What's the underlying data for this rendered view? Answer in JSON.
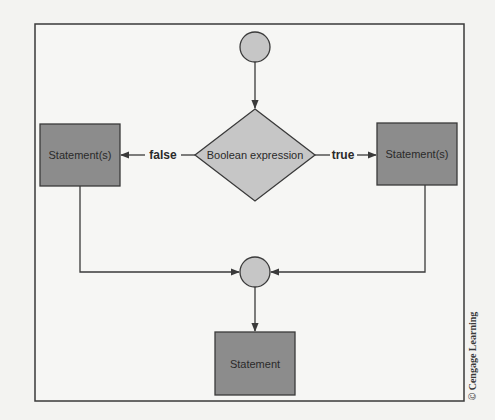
{
  "diagram": {
    "type": "flowchart",
    "colors": {
      "background": "#f3f3f1",
      "frame": "#3a3a3a",
      "stroke": "#3a3a3a",
      "box_fill": "#8c8c8c",
      "decision_fill": "#c6c6c6",
      "connector_fill": "#c6c6c6",
      "text": "#2a2a2a"
    },
    "nodes": [
      {
        "id": "start",
        "shape": "circle",
        "label": ""
      },
      {
        "id": "decision",
        "shape": "diamond",
        "label": "Boolean expression"
      },
      {
        "id": "false_branch",
        "shape": "rectangle",
        "label": "Statement(s)"
      },
      {
        "id": "true_branch",
        "shape": "rectangle",
        "label": "Statement(s)"
      },
      {
        "id": "join",
        "shape": "circle",
        "label": ""
      },
      {
        "id": "next",
        "shape": "rectangle",
        "label": "Statement"
      }
    ],
    "edges": [
      {
        "from": "start",
        "to": "decision",
        "label": ""
      },
      {
        "from": "decision",
        "to": "false_branch",
        "label": "false"
      },
      {
        "from": "decision",
        "to": "true_branch",
        "label": "true"
      },
      {
        "from": "false_branch",
        "to": "join",
        "label": ""
      },
      {
        "from": "true_branch",
        "to": "join",
        "label": ""
      },
      {
        "from": "join",
        "to": "next",
        "label": ""
      }
    ],
    "labels": {
      "decision": "Boolean expression",
      "false_box": "Statement(s)",
      "true_box": "Statement(s)",
      "bottom_box": "Statement",
      "false_edge": "false",
      "true_edge": "true"
    }
  },
  "credit": "© Cengage Learning"
}
